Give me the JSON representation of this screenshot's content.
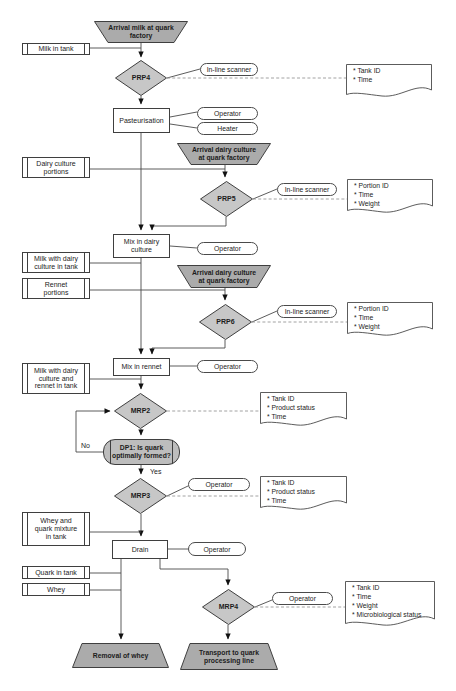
{
  "diagram": {
    "trapezoids": {
      "arrival_milk": [
        "Arrival milk at quark",
        "factory"
      ],
      "arrival_dairy_1": [
        "Arrival dairy culture",
        "at quark factory"
      ],
      "arrival_dairy_2": [
        "Arrival dairy culture",
        "at quark factory"
      ],
      "removal_whey": [
        "Removal of whey"
      ],
      "transport": [
        "Transport to quark",
        "processing line"
      ]
    },
    "tanks": {
      "milk_in_tank": [
        "Milk in tank"
      ],
      "dairy_culture_portions": [
        "Dairy culture",
        "portions"
      ],
      "milk_dairy_culture": [
        "Milk with dairy",
        "culture in tank"
      ],
      "rennet_portions": [
        "Rennet",
        "portions"
      ],
      "milk_dairy_rennet": [
        "Milk with dairy",
        "culture and",
        "rennet in tank"
      ],
      "whey_quark_mixture": [
        "Whey and",
        "quark mixture",
        "in tank"
      ],
      "quark_in_tank": [
        "Quark in tank"
      ],
      "whey": [
        "Whey"
      ]
    },
    "processes": {
      "pasteurisation": [
        "Pasteurisation"
      ],
      "mix_dairy": [
        "Mix in dairy",
        "culture"
      ],
      "mix_rennet": [
        "Mix in rennet"
      ],
      "drain": [
        "Drain"
      ]
    },
    "checkpoints": {
      "prp4": "PRP4",
      "prp5": "PRP5",
      "prp6": "PRP6",
      "mrp2": "MRP2",
      "mrp3": "MRP3",
      "mrp4": "MRP4"
    },
    "decision": {
      "dp1": [
        "DP1: Is quark",
        "optimally formed?"
      ],
      "no": "No",
      "yes": "Yes"
    },
    "resources": {
      "scanner1": "In-line scanner",
      "operator1": "Operator",
      "heater": "Heater",
      "scanner2": "In-line scanner",
      "operator2": "Operator",
      "scanner3": "In-line scanner",
      "operator3": "Operator",
      "operator4": "Operator",
      "operator5": "Operator",
      "operator6": "Operator"
    },
    "documents": {
      "doc_prp4": [
        "* Tank ID",
        "* Time"
      ],
      "doc_prp5": [
        "* Portion ID",
        "* Time",
        "* Weight"
      ],
      "doc_prp6": [
        "* Portion ID",
        "* Time",
        "* Weight"
      ],
      "doc_mrp2": [
        "* Tank ID",
        "* Product status",
        "* Time"
      ],
      "doc_mrp3": [
        "* Tank ID",
        "* Product status",
        "* Time"
      ],
      "doc_mrp4": [
        "* Tank ID",
        "* Time",
        "* Weight",
        "* Microbiological status"
      ]
    },
    "colors": {
      "terminator_fill": "#ababab",
      "checkpoint_fill": "#c7c7c7",
      "decision_fill": "#bdbdbd",
      "line_color": "#4a4a4a"
    }
  }
}
